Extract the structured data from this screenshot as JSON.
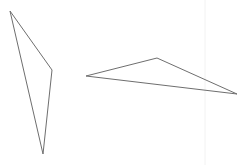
{
  "canvas": {
    "width": 247,
    "height": 165,
    "background": "#ffffff"
  },
  "guide_line": {
    "x": 205,
    "y1": 0,
    "y2": 165,
    "color": "#f2f2f2"
  },
  "shapes": [
    {
      "name": "triangle-left",
      "points": [
        [
          10,
          11
        ],
        [
          52,
          70
        ],
        [
          43,
          154
        ]
      ],
      "stroke": "#6e6e6e",
      "stroke_width": 1
    },
    {
      "name": "triangle-right",
      "points": [
        [
          86,
          76
        ],
        [
          157,
          58
        ],
        [
          237,
          94
        ]
      ],
      "stroke": "#6e6e6e",
      "stroke_width": 1
    }
  ]
}
